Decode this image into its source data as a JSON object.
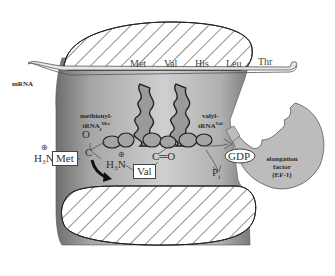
{
  "diagram": {
    "mrna_label": "mRNA",
    "codons": [
      "Met",
      "Val",
      "His",
      "Leu",
      "Thr"
    ],
    "trna_left": {
      "line1": "methionyl-",
      "line2": "tRNA",
      "sub": "f",
      "sup": "Met"
    },
    "trna_right": {
      "line1": "valyl-",
      "line2": "tRNA",
      "sup": "Val"
    },
    "chem": {
      "h3n_left": "H₃N",
      "charge_left": "⊕",
      "met_box": "Met",
      "carbon": "C",
      "oxygen": "O",
      "h3n_right": "H₃N",
      "charge_right": "⊕",
      "val_box": "Val",
      "co": "C═O",
      "pi": "P",
      "pi_sub": "i",
      "gdp": "GDP"
    },
    "ef_label": {
      "line1": "elongation",
      "line2": "factor",
      "line3": "(EF-1)"
    },
    "colors": {
      "ribosome_gray": "#a8a8a8",
      "ef_gray": "#bcbcbc",
      "trna_gray": "#9a9a9a",
      "outline": "#333333",
      "hatch": "#222222"
    }
  }
}
